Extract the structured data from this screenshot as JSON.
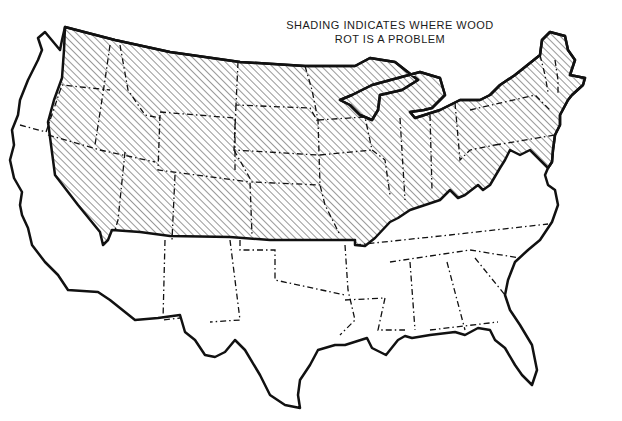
{
  "title": {
    "line1": "SHADING INDICATES WHERE WOOD",
    "line2": "ROT IS A PROBLEM"
  },
  "map": {
    "subject": "Contiguous United States",
    "shaded_region": "Northern and interior US (north of southern Kansas/Missouri border, Ohio River, and Virginia line; east of the Cascade/Sierra coastal strip) including New England",
    "unshaded_region": "Pacific coastal strip, Southwest, South and Southeast",
    "legend_pattern": "diagonal-hatching",
    "colors": {
      "outline": "#111111",
      "hatch": "#333333",
      "background": "#ffffff"
    }
  }
}
